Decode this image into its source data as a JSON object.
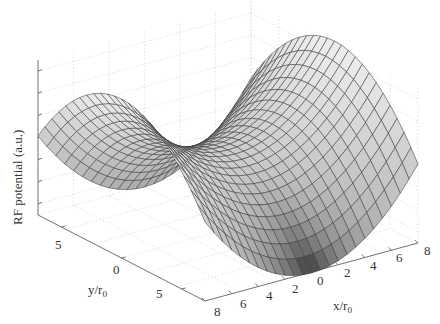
{
  "chart_data": {
    "type": "surface",
    "title": "",
    "function": "saddle: z ∝ (s² − t²), quadrupole RF potential",
    "xlabel": "x/r",
    "xlabel_sub": "0",
    "ylabel": "y/r",
    "ylabel_sub": "0",
    "zlabel": "RF potential (a.u.)",
    "xlim": [
      -8,
      8
    ],
    "ylim": [
      -8,
      8
    ],
    "x_ticks": [
      "8",
      "6",
      "4",
      "2",
      "0",
      "2",
      "4",
      "6",
      "8"
    ],
    "y_ticks": [
      "5",
      "0",
      "5"
    ],
    "z_ticks_count": 7,
    "z_tick_labels_shown": false,
    "grid": true,
    "colormap": "gray",
    "mesh_resolution": 24
  },
  "figure": {
    "background": "#ffffff",
    "text_color": "#333333",
    "axis_color": "#666666",
    "grid_color": "#cfcfcf",
    "mesh_line_color": "#3a3a3a"
  }
}
